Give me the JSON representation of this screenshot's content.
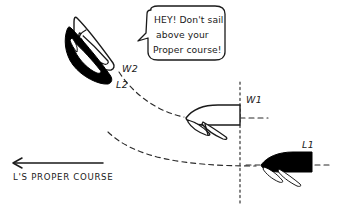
{
  "diagram": {
    "background_color": "#ffffff",
    "ink_color": "#1a1a1a",
    "width": 339,
    "height": 219
  },
  "speech_bubble": {
    "line1": "HEY! Don't sail",
    "line2": "above your",
    "line3": "Proper course!",
    "speaker": "W2"
  },
  "boats": [
    {
      "id": "w2",
      "label": "W2",
      "role": "windward",
      "fill": "outline",
      "heading": "up-left",
      "position": "upper-left"
    },
    {
      "id": "l2",
      "label": "L2",
      "role": "leeward",
      "fill": "solid-black",
      "heading": "up-left",
      "position": "mid-left"
    },
    {
      "id": "w1",
      "label": "W1",
      "role": "windward",
      "fill": "outline",
      "heading": "left",
      "position": "center-right"
    },
    {
      "id": "l1",
      "label": "L1",
      "role": "leeward",
      "fill": "solid-black",
      "heading": "left",
      "position": "lower-right"
    }
  ],
  "course_arrow": {
    "label": "L'S PROPER COURSE",
    "direction": "left"
  },
  "tracks": [
    {
      "id": "windward-track",
      "from": "W1",
      "to": "W2",
      "style": "dashed"
    },
    {
      "id": "leeward-track",
      "from": "L1",
      "to": "L2",
      "style": "dashed"
    }
  ],
  "reference_line": {
    "id": "vertical-reference",
    "style": "dotted",
    "orientation": "vertical"
  }
}
